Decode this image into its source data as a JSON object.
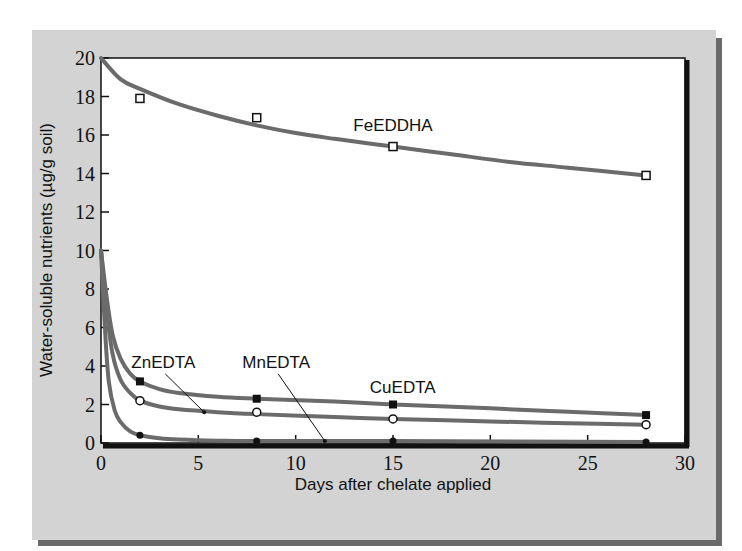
{
  "chart_data": {
    "type": "line",
    "title": "",
    "xlabel": "Days after chelate applied",
    "ylabel": "Water-soluble nutrients (µg/g soil)",
    "xlim": [
      0,
      30
    ],
    "ylim": [
      0,
      20
    ],
    "xticks": [
      0,
      5,
      10,
      15,
      20,
      25,
      30
    ],
    "yticks": [
      0,
      2,
      4,
      6,
      8,
      10,
      12,
      14,
      16,
      18,
      20
    ],
    "grid": false,
    "legend": "inline labels",
    "series": [
      {
        "name": "FeEDDHA",
        "marker": "open-square",
        "x": [
          2,
          8,
          15,
          28
        ],
        "values": [
          17.9,
          16.9,
          15.4,
          13.9
        ],
        "fit_curve": {
          "x": [
            0,
            1,
            2,
            4,
            6,
            8,
            10,
            12,
            15,
            18,
            21,
            24,
            28
          ],
          "y": [
            20,
            18.9,
            18.4,
            17.6,
            17.0,
            16.5,
            16.1,
            15.8,
            15.4,
            15.0,
            14.6,
            14.3,
            13.9
          ]
        }
      },
      {
        "name": "CuEDTA",
        "marker": "filled-square",
        "x": [
          2,
          8,
          15,
          28
        ],
        "values": [
          3.2,
          2.3,
          2.0,
          1.45
        ],
        "fit_curve": {
          "x": [
            0,
            0.3,
            0.6,
            1,
            1.5,
            2,
            3,
            4,
            6,
            8,
            12,
            15,
            20,
            24,
            28
          ],
          "y": [
            10,
            7.5,
            5.6,
            4.4,
            3.6,
            3.2,
            2.8,
            2.6,
            2.4,
            2.3,
            2.15,
            2.0,
            1.8,
            1.62,
            1.45
          ]
        }
      },
      {
        "name": "ZnEDTA",
        "marker": "open-circle",
        "x": [
          2,
          8,
          15,
          28
        ],
        "values": [
          2.2,
          1.6,
          1.25,
          0.95
        ],
        "fit_curve": {
          "x": [
            0,
            0.3,
            0.6,
            1,
            1.5,
            2,
            3,
            4,
            6,
            8,
            12,
            15,
            20,
            24,
            28
          ],
          "y": [
            10,
            6.8,
            4.6,
            3.3,
            2.6,
            2.2,
            1.9,
            1.75,
            1.6,
            1.5,
            1.35,
            1.25,
            1.12,
            1.03,
            0.95
          ]
        }
      },
      {
        "name": "MnEDTA",
        "marker": "filled-circle",
        "x": [
          2,
          8,
          15,
          28
        ],
        "values": [
          0.4,
          0.1,
          0.1,
          0.05
        ],
        "fit_curve": {
          "x": [
            0,
            0.2,
            0.4,
            0.7,
            1,
            1.5,
            2,
            3,
            4,
            6,
            8,
            15,
            28
          ],
          "y": [
            10,
            6.0,
            3.2,
            1.7,
            1.1,
            0.6,
            0.4,
            0.25,
            0.18,
            0.12,
            0.1,
            0.1,
            0.05
          ]
        }
      }
    ],
    "annotations": [
      {
        "text": "FeEDDHA",
        "x": 15,
        "y": 16.2,
        "leader": false
      },
      {
        "text": "CuEDTA",
        "x": 15.5,
        "y": 2.6,
        "leader": false
      },
      {
        "text": "ZnEDTA",
        "x": 3.2,
        "y": 3.9,
        "leader_to": [
          5.3,
          1.6
        ]
      },
      {
        "text": "MnEDTA",
        "x": 9.0,
        "y": 3.9,
        "leader_to": [
          11.5,
          0.1
        ]
      }
    ]
  },
  "colors": {
    "panel": "#d3d3d3",
    "panel_shadow": "#6a6a6a",
    "curve": "#6b6b6b",
    "axis": "#111111",
    "plot_bg": "#ffffff"
  }
}
